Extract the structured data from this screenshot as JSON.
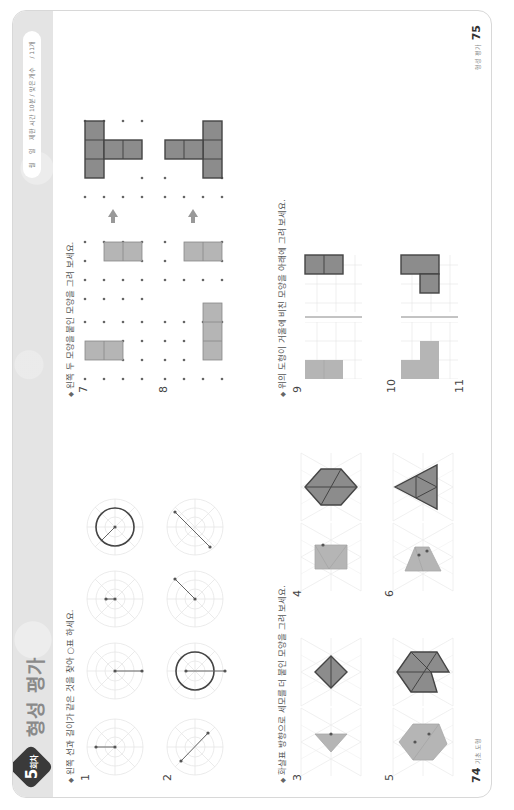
{
  "header": {
    "badge_number": "5",
    "badge_suffix": "회차",
    "title": "형성 평가",
    "timebox": {
      "month_label": "월",
      "day_label": "일",
      "time_label": "제한 시간 10분 / 맞은 개수",
      "score": "/ 11개"
    }
  },
  "left_page": {
    "section1": {
      "instruction": "왼쪽 선과 길이가 같은 것을 찾아 ○표 하세요.",
      "questions": [
        {
          "number": "1",
          "segment": "short horizontal",
          "choices": [
            "horizontal radius",
            "short horizontal",
            "circle with radius"
          ],
          "circled_choice": 3
        },
        {
          "number": "2",
          "segment": "diagonal",
          "choices": [
            "circle with vertical diameter",
            "diagonal radius",
            "long diagonal"
          ],
          "circled_choice": 1
        }
      ]
    },
    "section2": {
      "instruction": "화살표 방향으로 세모를 더 붙인 모양을 그려 보세요.",
      "questions": [
        {
          "number": "3",
          "given": "triangle",
          "answer": "rhombus of 2 triangles"
        },
        {
          "number": "4",
          "given": "trapezoid of 3 triangles",
          "answer": "parallelogram of 4 triangles"
        },
        {
          "number": "5",
          "given": "shape of 4 triangles",
          "answer": "hexagon-like shape of 5 triangles"
        },
        {
          "number": "6",
          "given": "2 triangles",
          "answer": "large triangle of 4 triangles"
        }
      ]
    },
    "footer": {
      "page_number": "74",
      "label": "기초 도형"
    }
  },
  "right_page": {
    "section3": {
      "instruction": "왼쪽 두 모양을 붙인 모양을 그려 보세요.",
      "questions": [
        {
          "number": "7",
          "pieces": [
            "2-square vertical",
            "2-square horizontal"
          ],
          "answer": "L of 4 squares"
        },
        {
          "number": "8",
          "pieces": [
            "3-square vertical",
            "2-square horizontal"
          ],
          "answer": "T of 5 squares"
        }
      ]
    },
    "section4": {
      "instruction": "위의 도형이 거울에 비친 모양을 아래에 그려 보세요.",
      "questions": [
        {
          "number": "9"
        },
        {
          "number": "10"
        },
        {
          "number": "11"
        }
      ]
    },
    "footer": {
      "label": "형성 평가",
      "page_number": "75"
    }
  },
  "colors": {
    "header_band": "#e4e4e4",
    "badge": "#3a3a3a",
    "shape_light": "#b5b5b5",
    "shape_dark": "#8c8c8c",
    "outline": "#444444"
  }
}
